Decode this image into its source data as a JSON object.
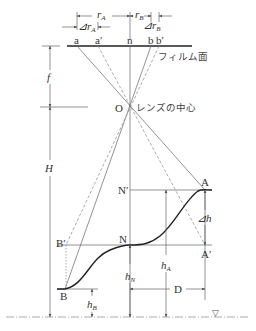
{
  "diagram": {
    "type": "aerial-photo-relief-displacement",
    "film": {
      "label": "フィルム面",
      "points": [
        {
          "id": "a",
          "label": "a"
        },
        {
          "id": "a_prime",
          "label": "a′"
        },
        {
          "id": "n",
          "label": "n"
        },
        {
          "id": "b",
          "label": "b"
        },
        {
          "id": "b_prime",
          "label": "b′"
        }
      ]
    },
    "dimensions_top": {
      "rA": {
        "main": "r",
        "sub": "A"
      },
      "rB": {
        "main": "r",
        "sub": "B"
      },
      "drA": {
        "prefix": "⊿",
        "main": "r",
        "sub": "A"
      },
      "drB": {
        "prefix": "⊿",
        "main": "r",
        "sub": "B"
      }
    },
    "lens": {
      "point_label": "O",
      "label": "レンズの中心"
    },
    "left_dims": {
      "f": "f",
      "H": "H"
    },
    "ground_points": {
      "A": "A",
      "A_prime": "A′",
      "N": "N",
      "N_prime": "N′",
      "B": "B",
      "B_prime": "B′"
    },
    "heights": {
      "dh": {
        "prefix": "⊿",
        "main": "h"
      },
      "hA": {
        "main": "h",
        "sub": "A"
      },
      "hN": {
        "main": "h",
        "sub": "N"
      },
      "hB": {
        "main": "h",
        "sub": "B"
      },
      "D": "D"
    },
    "datum_symbol": "▽",
    "colors": {
      "line": "#555555",
      "terrain": "#222222",
      "dashed": "#888888",
      "text": "#333333"
    }
  }
}
